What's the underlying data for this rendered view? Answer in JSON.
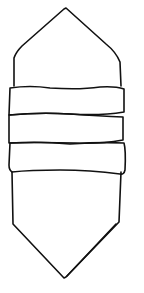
{
  "drawing": {
    "description": "Line drawing of an elongated hexagonal crystal-like shape with three horizontal bands in the middle",
    "stroke_color": "#111111",
    "background_color": "#ffffff",
    "parts": [
      {
        "name": "top-point-cap",
        "shape": "pentagon pointing up"
      },
      {
        "name": "band-1",
        "shape": "horizontal band"
      },
      {
        "name": "band-2",
        "shape": "horizontal band"
      },
      {
        "name": "band-3",
        "shape": "horizontal band"
      },
      {
        "name": "bottom-point-body",
        "shape": "pentagon pointing down"
      }
    ]
  }
}
